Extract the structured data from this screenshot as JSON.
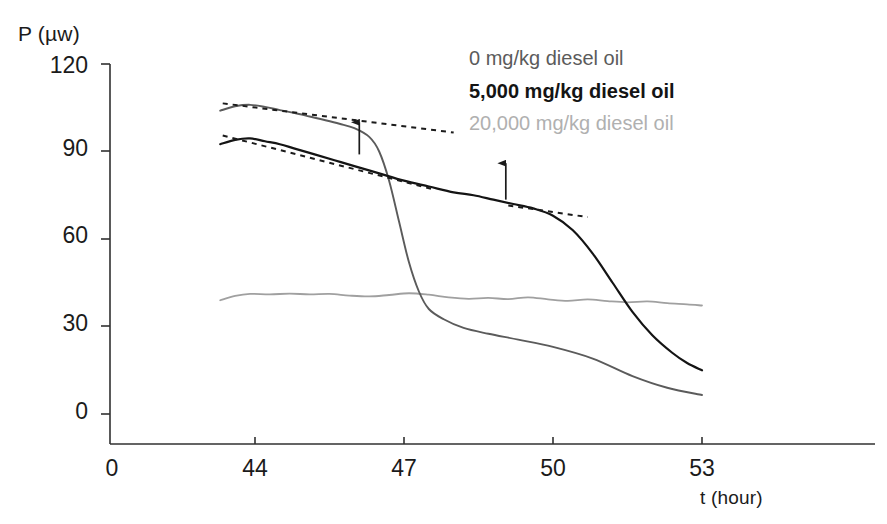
{
  "chart_data": {
    "type": "line",
    "title": "",
    "xlabel": "t (hour)",
    "ylabel": "P (µw)",
    "xlim": [
      43,
      54
    ],
    "ylim": [
      0,
      120
    ],
    "xticks": [
      0,
      44,
      47,
      50,
      53
    ],
    "yticks": [
      0,
      30,
      60,
      90,
      120
    ],
    "xtick_labels": [
      "0",
      "44",
      "47",
      "50",
      "53"
    ],
    "ytick_labels": [
      "0",
      "30",
      "60",
      "90",
      "120"
    ],
    "grid": false,
    "legend_position": "top-right",
    "series": [
      {
        "name": "0 mg/kg diesel oil",
        "color": "#5b5b5b",
        "x": [
          43.3,
          43.6,
          43.9,
          44.2,
          44.5,
          44.8,
          45.1,
          45.4,
          45.7,
          46.0,
          46.3,
          46.5,
          46.7,
          46.9,
          47.1,
          47.3,
          47.5,
          47.8,
          48.2,
          48.7,
          49.3,
          50.0,
          50.8,
          51.6,
          52.3,
          53.0
        ],
        "y": [
          104.0,
          105.5,
          106.0,
          105.3,
          104.2,
          103.2,
          102.0,
          100.8,
          99.5,
          98.0,
          95.0,
          90.0,
          80.0,
          66.0,
          52.0,
          42.0,
          36.0,
          32.5,
          29.5,
          27.5,
          25.5,
          23.0,
          19.0,
          13.0,
          9.0,
          6.5
        ]
      },
      {
        "name": "5,000 mg/kg diesel oil",
        "color": "#141414",
        "x": [
          43.3,
          43.6,
          43.9,
          44.2,
          44.5,
          44.8,
          45.2,
          45.6,
          46.0,
          46.5,
          47.0,
          47.5,
          48.0,
          48.4,
          48.8,
          49.2,
          49.6,
          50.0,
          50.4,
          50.8,
          51.2,
          51.6,
          52.0,
          52.4,
          52.7,
          53.0
        ],
        "y": [
          92.5,
          94.0,
          94.5,
          93.5,
          92.5,
          91.0,
          89.0,
          87.0,
          85.0,
          82.5,
          80.0,
          78.0,
          76.0,
          75.0,
          73.5,
          72.0,
          70.5,
          68.0,
          63.0,
          55.0,
          45.0,
          35.0,
          27.0,
          21.0,
          17.5,
          15.0
        ]
      },
      {
        "name": "20,000 mg/kg diesel oil",
        "color": "#a0a0a0",
        "x": [
          43.3,
          43.6,
          43.9,
          44.3,
          44.7,
          45.1,
          45.5,
          45.9,
          46.3,
          46.7,
          47.1,
          47.5,
          47.9,
          48.3,
          48.7,
          49.1,
          49.5,
          49.9,
          50.3,
          50.7,
          51.1,
          51.5,
          51.9,
          52.3,
          52.7,
          53.0
        ],
        "y": [
          39.0,
          40.5,
          41.2,
          41.0,
          41.3,
          41.0,
          41.2,
          40.6,
          40.3,
          40.8,
          41.4,
          40.9,
          40.0,
          39.5,
          39.8,
          39.4,
          40.0,
          39.3,
          38.8,
          39.3,
          38.7,
          38.3,
          38.6,
          38.0,
          37.6,
          37.2
        ]
      }
    ],
    "annotations": [
      {
        "type": "tangent-line",
        "style": "dashed",
        "series": "0 mg/kg diesel oil",
        "x_start": 43.35,
        "x_end": 48.0,
        "y_start": 106.5,
        "y_end": 96.5
      },
      {
        "type": "tangent-line",
        "style": "dashed",
        "series": "5,000 mg/kg diesel oil",
        "x_start": 43.35,
        "x_end": 47.6,
        "y_start": 95.5,
        "y_end": 77.0
      },
      {
        "type": "tangent-line",
        "style": "dashed",
        "series": "5,000 mg/kg diesel oil",
        "x_start": 49.1,
        "x_end": 50.7,
        "y_start": 71.5,
        "y_end": 67.5
      },
      {
        "type": "arrow",
        "direction": "up",
        "x": 46.1,
        "y_tail": 89.0,
        "y_head": 100.0
      },
      {
        "type": "arrow",
        "direction": "up",
        "x": 49.05,
        "y_tail": 73.5,
        "y_head": 86.0
      }
    ]
  },
  "axes": {
    "y_title": "P (µw)",
    "x_title": "t (hour)"
  },
  "legend": {
    "items": [
      {
        "label": "0 mg/kg diesel oil",
        "color": "#5b5b5b"
      },
      {
        "label": "5,000 mg/kg diesel oil",
        "color": "#141414"
      },
      {
        "label": "20,000 mg/kg diesel oil",
        "color": "#a0a0a0"
      }
    ]
  }
}
